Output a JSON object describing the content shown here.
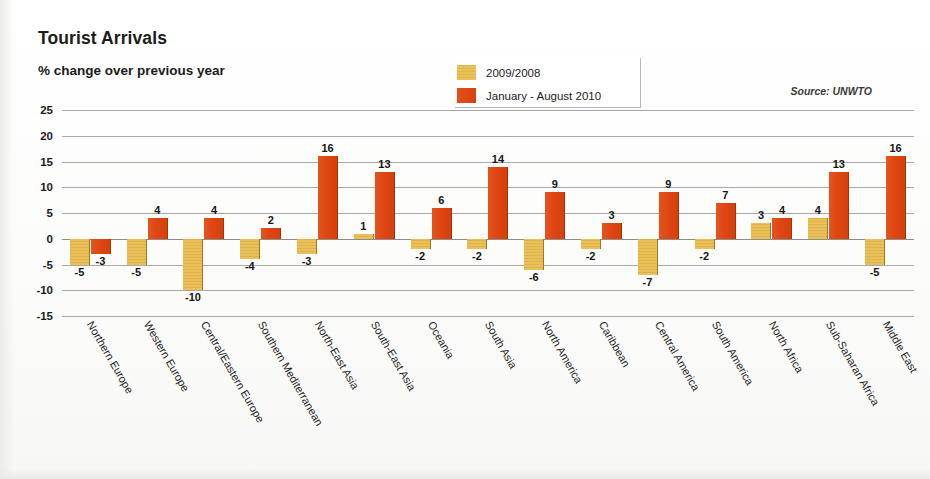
{
  "header": {
    "title": "Tourist Arrivals",
    "subtitle": "% change over previous year",
    "source": "Source: UNWTO"
  },
  "legend": {
    "items": [
      {
        "label": "2009/2008",
        "color": "#e5bb55",
        "swatch": "tan"
      },
      {
        "label": "January - August 2010",
        "color": "#de4614",
        "swatch": "orange"
      }
    ]
  },
  "chart_data": {
    "type": "bar",
    "title": "Tourist Arrivals",
    "subtitle": "% change over previous year",
    "xlabel": "",
    "ylabel": "% change over previous year",
    "ylim": [
      -15,
      25
    ],
    "yticks": [
      25,
      20,
      15,
      10,
      5,
      0,
      -5,
      -10,
      -15
    ],
    "grid": true,
    "legend_position": "top-center",
    "source": "Source: UNWTO",
    "categories": [
      "Northern Europe",
      "Western Europe",
      "Central/Eastern Europe",
      "Southern Mediterranean",
      "North-East Asia",
      "South-East Asia",
      "Oceania",
      "South Asia",
      "North America",
      "Caribbean",
      "Central America",
      "South America",
      "North Africa",
      "Sub-Saharan Africa",
      "Middle East"
    ],
    "series": [
      {
        "name": "2009/2008",
        "color": "#e5bb55",
        "values": [
          -5,
          -5,
          -10,
          -4,
          -3,
          1,
          -2,
          -2,
          -6,
          -2,
          -7,
          -2,
          3,
          4,
          -5
        ]
      },
      {
        "name": "January - August 2010",
        "color": "#de4614",
        "values": [
          -3,
          4,
          4,
          2,
          16,
          13,
          6,
          14,
          9,
          3,
          9,
          7,
          4,
          13,
          16
        ]
      }
    ]
  }
}
